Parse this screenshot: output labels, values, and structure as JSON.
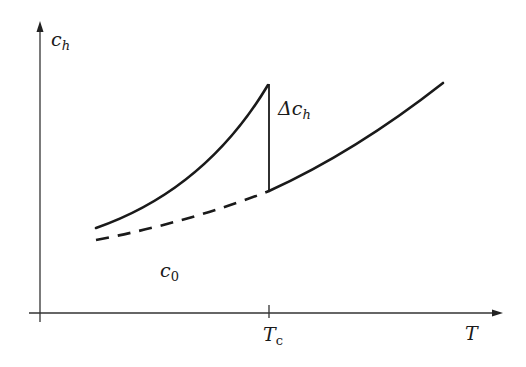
{
  "diagram": {
    "colors": {
      "ink": "#1a1a1a",
      "background": "#ffffff"
    },
    "axes": {
      "y_label": {
        "main": "c",
        "sub": "h"
      },
      "x_label": "T",
      "x_tick": {
        "main": "T",
        "sub": "c"
      }
    },
    "annotations": {
      "jump_label": {
        "prefix": "Δc",
        "sub": "h"
      },
      "baseline_label": {
        "main": "c",
        "sub": "0"
      }
    },
    "curves": [
      {
        "name": "c_h below Tc",
        "style": "solid"
      },
      {
        "name": "c_0 extrapolated",
        "style": "dashed"
      },
      {
        "name": "c_h above Tc",
        "style": "solid"
      },
      {
        "name": "jump at Tc",
        "style": "solid vertical"
      }
    ]
  }
}
